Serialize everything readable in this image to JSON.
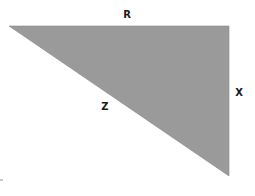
{
  "diagram": {
    "type": "right-triangle",
    "fill_color": "#9a9a9a",
    "stroke_color": "#8a8a8a",
    "vertices": {
      "top_left": [
        9,
        26
      ],
      "top_right": [
        229,
        26
      ],
      "bottom_right": [
        229,
        176
      ]
    },
    "labels": {
      "top_side": {
        "text": "R",
        "position": [
          127,
          15
        ]
      },
      "right_side": {
        "text": "X",
        "position": [
          239,
          93
        ]
      },
      "hypotenuse": {
        "text": "Z",
        "position": [
          105,
          107
        ]
      }
    }
  }
}
